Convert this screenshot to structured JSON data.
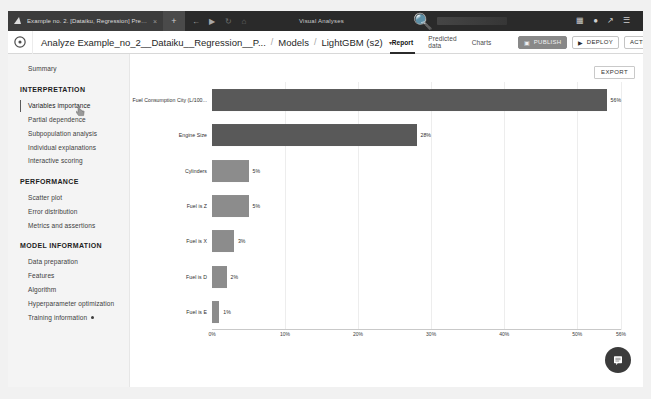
{
  "browser": {
    "tab_title": "Example no. 2. [Dataiku, Regression] Predi...",
    "tab_close_label": "×",
    "new_tab_label": "+",
    "back_icon": "back-arrow-icon",
    "forward_icon": "forward-arrow-icon",
    "reload_icon": "reload-icon",
    "home_icon": "home-icon",
    "url_text": "Visual Analyses",
    "search_icon": "search-icon",
    "apps_icon": "apps-grid-icon",
    "account_icon": "account-icon",
    "activity_icon": "activity-icon",
    "menu_icon": "menu-icon"
  },
  "appbar": {
    "logo_icon": "dataiku-logo-icon",
    "breadcrumb": [
      {
        "label": "Analyze Example_no_2__Dataiku__Regression__P...",
        "has_caret": false
      },
      {
        "label": "Models",
        "has_caret": false
      },
      {
        "label": "LightGBM (s2)",
        "has_caret": true
      }
    ],
    "separator": "/",
    "caret": "▾",
    "tabs": [
      {
        "label": "Report",
        "active": true
      },
      {
        "label": "Predicted data",
        "active": false
      },
      {
        "label": "Charts",
        "active": false
      }
    ],
    "publish_label": "PUBLISH",
    "publish_icon": "publish-icon",
    "deploy_label": "DEPLOY",
    "deploy_icon": "play-icon",
    "actions_label": "ACTIONS",
    "actions_caret": "▾"
  },
  "sidebar": {
    "groups": [
      {
        "heading": "",
        "items": [
          {
            "label": "Summary",
            "active": false,
            "dot": false
          }
        ]
      },
      {
        "heading": "INTERPRETATION",
        "items": [
          {
            "label": "Variables importance",
            "active": true,
            "dot": false
          },
          {
            "label": "Partial dependence",
            "active": false,
            "dot": false
          },
          {
            "label": "Subpopulation analysis",
            "active": false,
            "dot": false
          },
          {
            "label": "Individual explanations",
            "active": false,
            "dot": false
          },
          {
            "label": "Interactive scoring",
            "active": false,
            "dot": false
          }
        ]
      },
      {
        "heading": "PERFORMANCE",
        "items": [
          {
            "label": "Scatter plot",
            "active": false,
            "dot": false
          },
          {
            "label": "Error distribution",
            "active": false,
            "dot": false
          },
          {
            "label": "Metrics and assertions",
            "active": false,
            "dot": false
          }
        ]
      },
      {
        "heading": "MODEL INFORMATION",
        "items": [
          {
            "label": "Data preparation",
            "active": false,
            "dot": false
          },
          {
            "label": "Features",
            "active": false,
            "dot": false
          },
          {
            "label": "Algorithm",
            "active": false,
            "dot": false
          },
          {
            "label": "Hyperparameter optimization",
            "active": false,
            "dot": false
          },
          {
            "label": "Training information",
            "active": false,
            "dot": true
          }
        ]
      }
    ]
  },
  "main": {
    "export_label": "EXPORT",
    "chat_icon": "chat-bubble-icon"
  },
  "chart_data": {
    "type": "bar",
    "orientation": "horizontal",
    "title": "",
    "xlabel": "",
    "ylabel": "",
    "categories": [
      "Fuel Consumption City (L/100...",
      "Engine Size",
      "Cylinders",
      "Fuel is Z",
      "Fuel is X",
      "Fuel is D",
      "Fuel is E"
    ],
    "values": [
      56,
      28,
      5,
      5,
      3,
      2,
      1
    ],
    "value_labels": [
      "56%",
      "28%",
      "5%",
      "5%",
      "3%",
      "2%",
      "1%"
    ],
    "xlim": [
      0,
      56
    ],
    "xticks": [
      0,
      10,
      20,
      30,
      40,
      50,
      56
    ],
    "xtick_labels": [
      "0%",
      "10%",
      "20%",
      "30%",
      "40%",
      "50%",
      "56%"
    ],
    "grid": true,
    "legend": false,
    "bar_color": "#6f6f6f",
    "bar_color_dark": "#595959",
    "bar_color_light": "#8c8c8c"
  }
}
